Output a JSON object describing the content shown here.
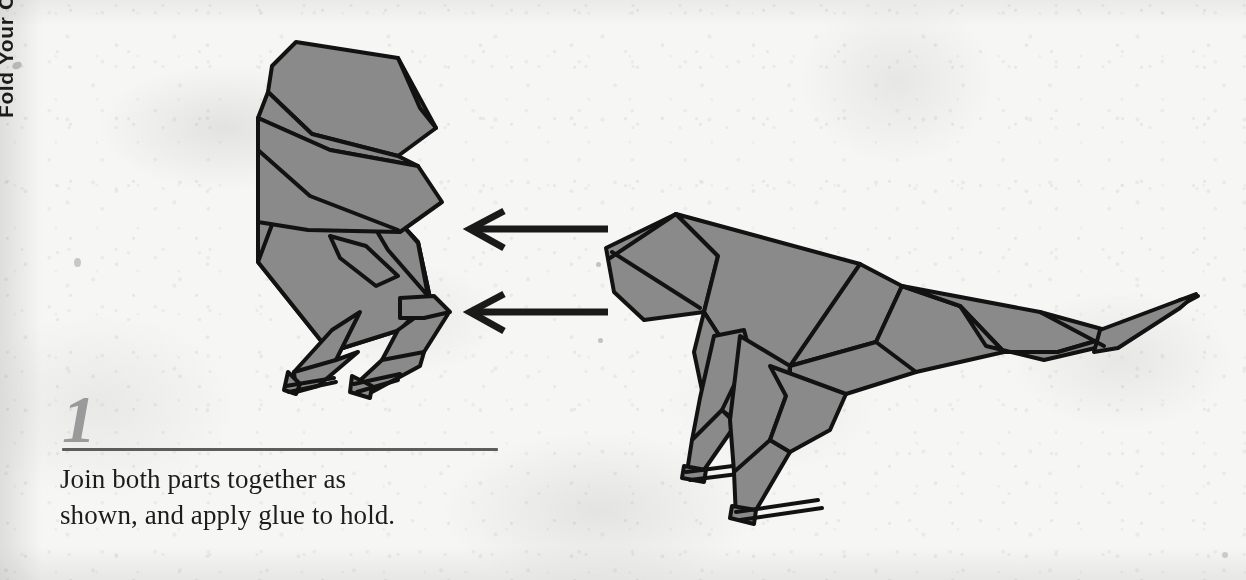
{
  "page": {
    "background_color": "#f6f6f4",
    "width": 1246,
    "height": 580
  },
  "spine": {
    "cropped_vertical_text": "Fold Your Own Dinosaur"
  },
  "step": {
    "number": "1",
    "caption_line_1": "Join both parts together as",
    "caption_line_2": "shown, and apply glue to hold.",
    "number_color": "#9a9a9a",
    "rule_color": "#5d5d5d",
    "caption_color": "#1c1c1c"
  },
  "diagram": {
    "fill_color": "#8a8a8a",
    "stroke_color": "#121212",
    "arrow_color": "#1a1a1a",
    "left_part": {
      "name": "head-and-neck-part",
      "label": "Head, neck and forelimbs section"
    },
    "right_part": {
      "name": "body-and-tail-part",
      "label": "Body, legs and tail section"
    },
    "arrows": [
      {
        "name": "assembly-arrow-upper",
        "direction": "left"
      },
      {
        "name": "assembly-arrow-lower",
        "direction": "left"
      }
    ]
  }
}
